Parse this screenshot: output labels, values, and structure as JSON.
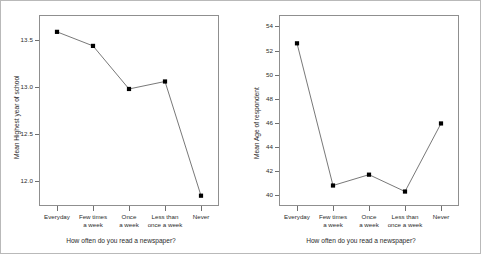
{
  "figure": {
    "background_color": "#ffffff",
    "border_color": "#b9b9b9",
    "marker_color": "#000000",
    "line_color": "#555555"
  },
  "chart_data": [
    {
      "type": "line",
      "panel": "left",
      "title": "",
      "xlabel": "How often do you read a newspaper?",
      "ylabel": "Mean Highest year of school",
      "categories": [
        "Everyday",
        "Few times\na week",
        "Once\na week",
        "Less than\nonce a week",
        "Never"
      ],
      "values": [
        13.59,
        13.44,
        12.98,
        13.06,
        11.84
      ],
      "yticks": [
        "12.0",
        "12.5",
        "13.0",
        "13.5"
      ],
      "ytick_values": [
        12.0,
        12.5,
        13.0,
        13.5
      ],
      "ylim": [
        11.73,
        13.77
      ],
      "grid": false,
      "legend": "none"
    },
    {
      "type": "line",
      "panel": "right",
      "title": "",
      "xlabel": "How often do you read a newspaper?",
      "ylabel": "Mean Age of respondent",
      "categories": [
        "Everyday",
        "Few times\na week",
        "Once\na week",
        "Less than\nonce a week",
        "Never"
      ],
      "values": [
        52.6,
        40.8,
        41.7,
        40.3,
        45.95
      ],
      "yticks": [
        "40",
        "42",
        "44",
        "46",
        "48",
        "50",
        "52",
        "54"
      ],
      "ytick_values": [
        40,
        42,
        44,
        46,
        48,
        50,
        52,
        54
      ],
      "ylim": [
        39.1,
        54.95
      ],
      "grid": false,
      "legend": "none"
    }
  ]
}
